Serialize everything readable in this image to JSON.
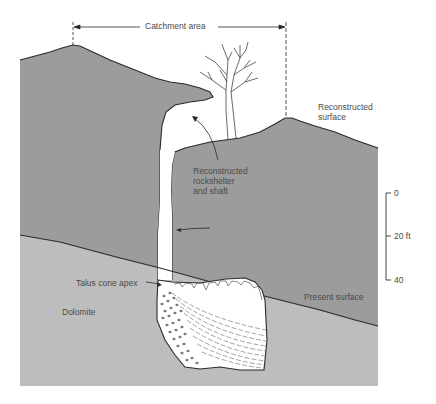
{
  "figure": {
    "type": "geological cross-section",
    "colors": {
      "background": "#ffffff",
      "upper_rock": "#9c9c9c",
      "dolomite": "#bdbdbd",
      "cave_fill": "#ffffff",
      "line": "#2a2a2a",
      "text": "#4a4a4a"
    }
  },
  "labels": {
    "catchment_area": "Catchment area",
    "reconstructed_surface": "Reconstructed\nsurface",
    "reconstructed_rockshelter": "Reconstructed\nrockshelter\nand shaft",
    "talus_cone_apex": "Talus cone apex",
    "present_surface": "Present surface",
    "dolomite": "Dolomite"
  },
  "scale_bar": {
    "ticks": [
      "0",
      "20 ft",
      "40"
    ]
  }
}
